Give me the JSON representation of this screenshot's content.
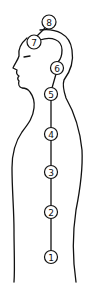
{
  "diagram": {
    "type": "body-profile-with-numbered-points",
    "stroke_color": "#111111",
    "background": "#ffffff",
    "points": [
      {
        "label": "1",
        "cx": 51,
        "cy": 257
      },
      {
        "label": "2",
        "cx": 51,
        "cy": 212
      },
      {
        "label": "3",
        "cx": 51,
        "cy": 172
      },
      {
        "label": "4",
        "cx": 51,
        "cy": 134
      },
      {
        "label": "5",
        "cx": 51,
        "cy": 94
      },
      {
        "label": "6",
        "cx": 57,
        "cy": 68
      },
      {
        "label": "7",
        "cx": 34,
        "cy": 42
      },
      {
        "label": "8",
        "cx": 49,
        "cy": 22
      }
    ]
  }
}
